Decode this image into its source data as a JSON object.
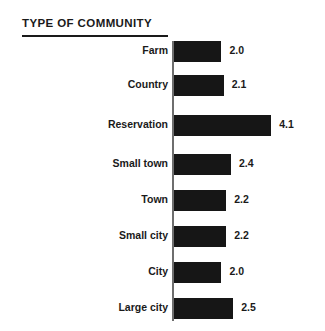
{
  "chart": {
    "title": "TYPE OF COMMUNITY"
  },
  "chart_data": {
    "type": "bar",
    "orientation": "horizontal",
    "title": "TYPE OF COMMUNITY",
    "xlabel": "",
    "ylabel": "",
    "grid": false,
    "legend": false,
    "axis_baseline": 0,
    "xlim": [
      0,
      4.1
    ],
    "categories": [
      "Farm",
      "Country",
      "Reservation",
      "Small town",
      "Town",
      "Small city",
      "City",
      "Large city"
    ],
    "values": [
      2.0,
      2.1,
      4.1,
      2.4,
      2.2,
      2.2,
      2.0,
      2.5
    ],
    "value_labels": [
      "2.0",
      "2.1",
      "4.1",
      "2.4",
      "2.2",
      "2.2",
      "2.0",
      "2.5"
    ],
    "bar_color": "#161616",
    "axis_color": "#6e6e6e",
    "text_color": "#1a1a1a",
    "background_color": "#ffffff"
  }
}
